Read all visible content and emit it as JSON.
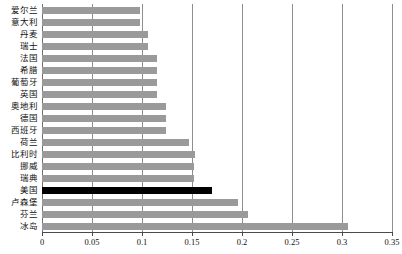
{
  "chart_data": {
    "type": "bar",
    "orientation": "horizontal",
    "title": "",
    "subtitle": "",
    "xlabel": "",
    "ylabel": "",
    "xlim": [
      0,
      0.35
    ],
    "xticks": [
      "0",
      "0.05",
      "0.1",
      "0.15",
      "0.2",
      "0.25",
      "0.3",
      "0.35"
    ],
    "xtick_values": [
      0,
      0.05,
      0.1,
      0.15,
      0.2,
      0.25,
      0.3,
      0.35
    ],
    "grid": "vertical",
    "legend": "none",
    "categories": [
      "爱尔兰",
      "意大利",
      "丹麦",
      "瑞士",
      "法国",
      "希腊",
      "葡萄牙",
      "英国",
      "奥地利",
      "德国",
      "西班牙",
      "荷兰",
      "比利时",
      "挪威",
      "瑞典",
      "美国",
      "卢森堡",
      "芬兰",
      "冰岛"
    ],
    "values": [
      0.098,
      0.098,
      0.106,
      0.106,
      0.115,
      0.115,
      0.115,
      0.115,
      0.124,
      0.124,
      0.124,
      0.147,
      0.153,
      0.152,
      0.152,
      0.17,
      0.196,
      0.206,
      0.306
    ],
    "highlight_category": "美国",
    "colors": {
      "bar": "#9a9a9a",
      "highlight_bar": "#000000",
      "gridline": "#8e8e8e",
      "axis": "#4a4a4a",
      "background": "#ffffff",
      "text": "#111111"
    }
  }
}
